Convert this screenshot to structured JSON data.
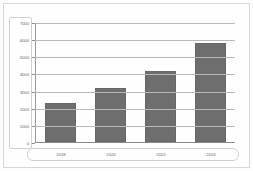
{
  "chart_data": {
    "type": "bar",
    "title": "",
    "xlabel": "",
    "ylabel": "",
    "categories": [
      "2018",
      "2020",
      "2022",
      "2024"
    ],
    "values": [
      2300,
      3150,
      4150,
      5800
    ],
    "series": [
      {
        "name": "Value",
        "values": [
          2300,
          3150,
          4150,
          5800
        ]
      }
    ],
    "ylim": [
      0,
      7000
    ],
    "ytick_labels": [
      "7000",
      "6000",
      "5000",
      "4000",
      "3000",
      "2000",
      "1000",
      "0"
    ],
    "ytick_values": [
      7000,
      6000,
      5000,
      4000,
      3000,
      2000,
      1000,
      0
    ],
    "grid": true,
    "legend": false,
    "legend_position": "none",
    "colors": {
      "bar_fill": "#6e6e6e",
      "bar_edge": "#676767",
      "gridline": "#b9b9b9",
      "axis_line": "#8a8a8a",
      "tick_text": "#6b6b6b",
      "frame": "#d8d8d8",
      "background": "#fefefe"
    }
  }
}
